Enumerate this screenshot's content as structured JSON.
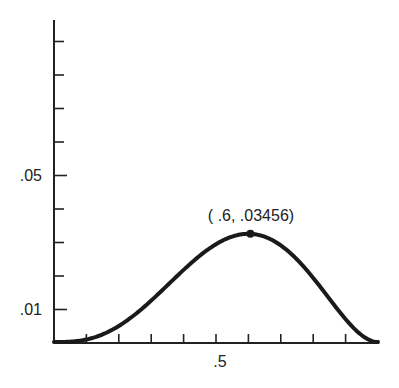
{
  "chart_data": {
    "type": "line",
    "title": "",
    "xlabel": "",
    "ylabel": "",
    "function": "f(x) = x^3 (1 - x)^2",
    "xlim": [
      0,
      1
    ],
    "ylim": [
      0,
      0.09
    ],
    "grid": false,
    "legend": null,
    "x_ticks": [
      0.1,
      0.2,
      0.3,
      0.4,
      0.5,
      0.6,
      0.7,
      0.8,
      0.9
    ],
    "x_tick_labels": [
      {
        "value": 0.5,
        "label": ".5"
      }
    ],
    "y_ticks": [
      0.01,
      0.02,
      0.03,
      0.04,
      0.05,
      0.06,
      0.07,
      0.08,
      0.09
    ],
    "y_tick_labels": [
      {
        "value": 0.01,
        "label": ".01"
      },
      {
        "value": 0.05,
        "label": ".05"
      }
    ],
    "series": [
      {
        "name": "x^3(1-x)^2",
        "x": [
          0,
          0.05,
          0.1,
          0.15,
          0.2,
          0.25,
          0.3,
          0.35,
          0.4,
          0.45,
          0.5,
          0.55,
          0.6,
          0.65,
          0.7,
          0.75,
          0.8,
          0.85,
          0.9,
          0.95,
          1.0
        ],
        "y": [
          0,
          0.00011,
          0.00081,
          0.00244,
          0.00512,
          0.00879,
          0.01323,
          0.01811,
          0.02304,
          0.02757,
          0.03125,
          0.03369,
          0.03456,
          0.03364,
          0.03087,
          0.02637,
          0.02048,
          0.01382,
          0.00729,
          0.00214,
          0
        ]
      }
    ],
    "annotations": [
      {
        "x": 0.6,
        "y": 0.03456,
        "label": "( .6, .03456)",
        "marker": "dot"
      }
    ]
  },
  "labels": {
    "y_01": ".01",
    "y_05": ".05",
    "x_5": ".5",
    "peak": "( .6, .03456)"
  }
}
